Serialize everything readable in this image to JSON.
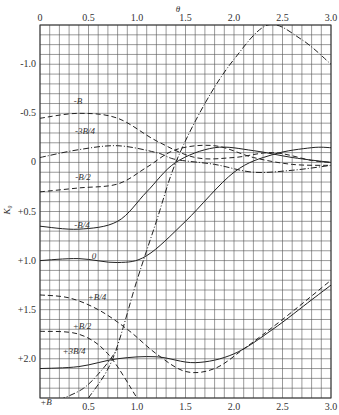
{
  "chart_data": {
    "type": "line",
    "title": "",
    "xlabel": "θ",
    "ylabel": "K₀",
    "xlim": [
      0,
      3.0
    ],
    "ylim": [
      -1.4,
      2.4
    ],
    "y_inverted": true,
    "grid": true,
    "x_ticks": [
      "0",
      "0.5",
      "1.0",
      "1.5",
      "2.0",
      "2.5",
      "3.0"
    ],
    "y_ticks": [
      "-1.0",
      "-0.5",
      "0",
      "+0.5",
      "+1.0",
      "+1.5",
      "+2.0"
    ],
    "series": [
      {
        "name": "-B",
        "style": "dashed",
        "x": [
          0,
          0.4,
          0.8,
          1.2,
          1.6,
          2.0,
          2.4,
          2.8,
          3.0
        ],
        "y": [
          -0.45,
          -0.5,
          -0.45,
          -0.22,
          -0.05,
          -0.05,
          -0.1,
          -0.02,
          0.0
        ]
      },
      {
        "name": "-3B/4",
        "style": "dash-dot",
        "x": [
          0,
          0.4,
          0.8,
          1.2,
          1.4,
          1.8,
          2.2,
          2.6,
          3.0
        ],
        "y": [
          -0.05,
          -0.13,
          -0.17,
          -0.1,
          -0.03,
          0.02,
          0.1,
          0.08,
          0.03
        ]
      },
      {
        "name": "-B/2",
        "style": "dashed",
        "x": [
          0,
          0.4,
          0.8,
          1.1,
          1.4,
          1.8,
          2.2,
          2.6,
          3.0
        ],
        "y": [
          0.3,
          0.26,
          0.22,
          0.05,
          -0.13,
          -0.17,
          -0.05,
          0.02,
          0.03
        ]
      },
      {
        "name": "-B/4",
        "style": "solid",
        "x": [
          0,
          0.4,
          0.8,
          1.1,
          1.4,
          1.8,
          2.2,
          2.6,
          3.0
        ],
        "y": [
          0.65,
          0.68,
          0.6,
          0.3,
          0.0,
          -0.15,
          -0.12,
          -0.05,
          0.0
        ]
      },
      {
        "name": "0",
        "style": "solid",
        "x": [
          0,
          0.4,
          0.8,
          1.1,
          1.5,
          2.0,
          2.4,
          2.8,
          3.0
        ],
        "y": [
          1.0,
          0.98,
          1.02,
          0.95,
          0.6,
          0.1,
          -0.08,
          -0.15,
          -0.15
        ]
      },
      {
        "name": "theta-line",
        "style": "dash-dot",
        "x": [
          0.5,
          0.75,
          1.0,
          1.2,
          1.4,
          1.7,
          2.0,
          2.35,
          2.7,
          3.0
        ],
        "y": [
          2.4,
          2.0,
          1.2,
          0.6,
          0.0,
          -0.6,
          -1.05,
          -1.4,
          -1.25,
          -1.0
        ]
      },
      {
        "name": "+B/4",
        "style": "dashed",
        "x": [
          0,
          0.3,
          0.6,
          0.9,
          1.2,
          1.5,
          1.8,
          2.1,
          2.5,
          3.0
        ],
        "y": [
          1.35,
          1.38,
          1.5,
          1.7,
          1.95,
          2.13,
          2.1,
          1.9,
          1.6,
          1.2
        ]
      },
      {
        "name": "+B/2",
        "style": "dashed",
        "x": [
          0,
          0.4,
          0.7,
          1.0
        ],
        "y": [
          1.72,
          1.75,
          1.95,
          2.4
        ]
      },
      {
        "name": "+3B/4",
        "style": "solid",
        "x": [
          0,
          0.4,
          0.8,
          1.2,
          1.6,
          2.0,
          2.4,
          2.8,
          3.0
        ],
        "y": [
          2.1,
          2.08,
          2.0,
          1.98,
          2.04,
          1.95,
          1.7,
          1.4,
          1.25
        ]
      },
      {
        "name": "+B",
        "style": "dash-dot",
        "x": [
          0.2,
          0.45,
          0.65,
          0.8
        ],
        "y": [
          2.42,
          2.3,
          2.1,
          1.9
        ]
      }
    ],
    "annotations": [
      "-B",
      "-3B/4",
      "-B/2",
      "-B/4",
      "0",
      "+B/4",
      "+B/2",
      "+3B/4",
      "+B"
    ]
  },
  "labels": {
    "x_title": "θ",
    "y_title": "K₀",
    "caption": "图 7"
  }
}
